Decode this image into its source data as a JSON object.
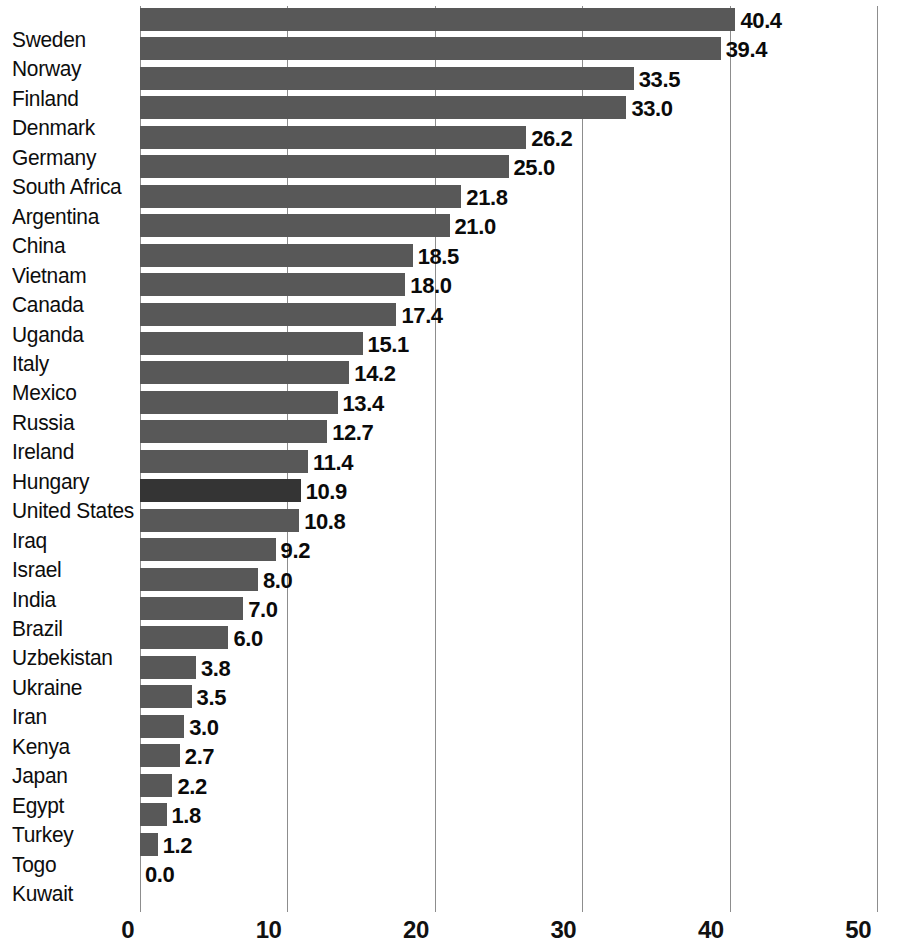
{
  "chart_data": {
    "type": "bar",
    "orientation": "horizontal",
    "title": "",
    "subtitle": "",
    "xlabel": "",
    "ylabel": "",
    "xlim": [
      0,
      50
    ],
    "ylim": null,
    "grid": true,
    "legend": null,
    "xticks": [
      "0",
      "10",
      "20",
      "30",
      "40",
      "50"
    ],
    "xtick_values": [
      0,
      10,
      20,
      30,
      40,
      50
    ],
    "categories": [
      "Sweden",
      "Norway",
      "Finland",
      "Denmark",
      "Germany",
      "South Africa",
      "Argentina",
      "China",
      "Vietnam",
      "Canada",
      "Uganda",
      "Italy",
      "Mexico",
      "Russia",
      "Ireland",
      "Hungary",
      "United States",
      "Iraq",
      "Israel",
      "India",
      "Brazil",
      "Uzbekistan",
      "Ukraine",
      "Iran",
      "Kenya",
      "Japan",
      "Egypt",
      "Turkey",
      "Togo",
      "Kuwait"
    ],
    "values": [
      40.4,
      39.4,
      33.5,
      33.0,
      26.2,
      25.0,
      21.8,
      21.0,
      18.5,
      18.0,
      17.4,
      15.1,
      14.2,
      13.4,
      12.7,
      11.4,
      10.9,
      10.8,
      9.2,
      8.0,
      7.0,
      6.0,
      3.8,
      3.5,
      3.0,
      2.7,
      2.2,
      1.8,
      1.2,
      0.0
    ],
    "value_labels": [
      "40.4",
      "39.4",
      "33.5",
      "33.0",
      "26.2",
      "25.0",
      "21.8",
      "21.0",
      "18.5",
      "18.0",
      "17.4",
      "15.1",
      "14.2",
      "13.4",
      "12.7",
      "11.4",
      "10.9",
      "10.8",
      "9.2",
      "8.0",
      "7.0",
      "6.0",
      "3.8",
      "3.5",
      "3.0",
      "2.7",
      "2.2",
      "1.8",
      "1.2",
      "0.0"
    ],
    "highlighted_category": "United States",
    "colors": {
      "bar": "#585858",
      "bar_highlight": "#343434",
      "gridline": "#8d8d8d",
      "text": "#0d0d0d",
      "background": "#ffffff"
    }
  }
}
